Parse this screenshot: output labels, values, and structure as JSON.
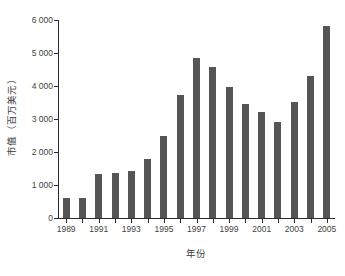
{
  "chart_data": {
    "type": "bar",
    "title": "",
    "subtitle": "",
    "xlabel": "年份",
    "ylabel": "市值（百万美元）",
    "categories": [
      "1989",
      "1990",
      "1991",
      "1992",
      "1993",
      "1994",
      "1995",
      "1996",
      "1997",
      "1998",
      "1999",
      "2000",
      "2001",
      "2002",
      "2003",
      "2004",
      "2005"
    ],
    "values": [
      600,
      600,
      1340,
      1360,
      1420,
      1790,
      2490,
      3730,
      4840,
      4580,
      3960,
      3470,
      3210,
      2910,
      3530,
      4290,
      5810
    ],
    "series": [
      {
        "name": "市值",
        "values": [
          600,
          600,
          1340,
          1360,
          1420,
          1790,
          2490,
          3730,
          4840,
          4580,
          3960,
          3470,
          3210,
          2910,
          3530,
          4290,
          5810
        ]
      }
    ],
    "ylim": [
      0,
      6000
    ],
    "ytick_values": [
      0,
      1000,
      2000,
      3000,
      4000,
      5000,
      6000
    ],
    "ytick_labels": [
      "0",
      "1 000",
      "2 000",
      "3 000",
      "4 000",
      "5 000",
      "6 000"
    ],
    "xtick_labels": [
      "1989",
      "1991",
      "1993",
      "1995",
      "1997",
      "1999",
      "2001",
      "2003",
      "2005"
    ],
    "xtick_categories": [
      "1989",
      "1991",
      "1993",
      "1995",
      "1997",
      "1999",
      "2001",
      "2003",
      "2005"
    ],
    "grid": false,
    "legend": false,
    "legend_position": "none",
    "bar_color": "#555555",
    "axis_color": "#2b2b2b",
    "background_color": "#ffffff",
    "annotations": []
  }
}
